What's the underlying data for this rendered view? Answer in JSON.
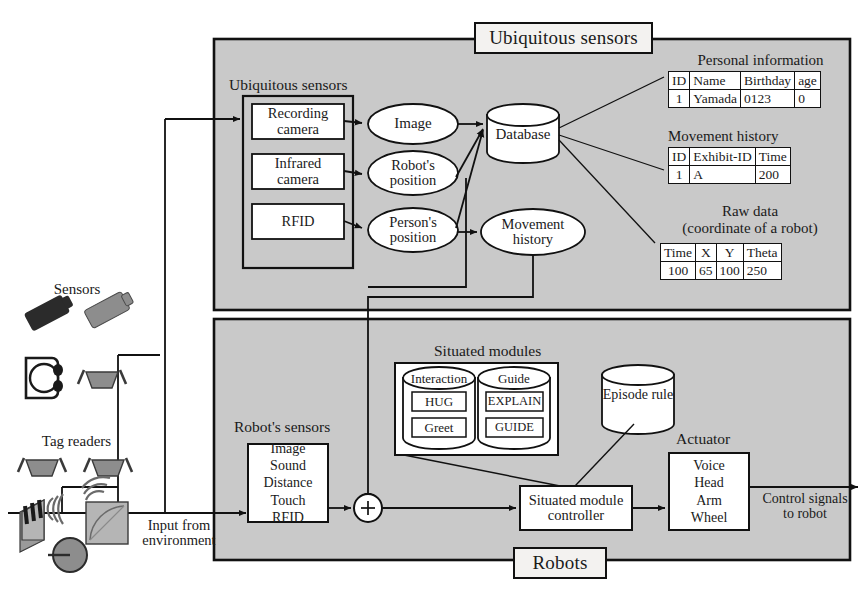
{
  "figure": {
    "top_panel_banner": "Ubiquitous sensors",
    "bottom_panel_banner": "Robots"
  },
  "top_panel": {
    "group_title": "Ubiquitous sensors",
    "sensor_boxes": [
      {
        "label": "Recording\ncamera"
      },
      {
        "label": "Infrared\ncamera"
      },
      {
        "label": "RFID"
      }
    ],
    "data_ellipses": [
      {
        "label": "Image"
      },
      {
        "label": "Robot's\nposition"
      },
      {
        "label": "Person's\nposition"
      }
    ],
    "movement_ellipse": {
      "label": "Movement\nhistory"
    },
    "database": {
      "label": "Database"
    }
  },
  "tables": [
    {
      "caption": "Personal information",
      "headers": [
        "ID",
        "Name",
        "Birthday",
        "age"
      ],
      "rows": [
        [
          "1",
          "Yamada",
          "0123",
          "0"
        ]
      ]
    },
    {
      "caption": "Movement history",
      "headers": [
        "ID",
        "Exhibit-ID",
        "Time"
      ],
      "rows": [
        [
          "1",
          "A",
          "200"
        ]
      ]
    },
    {
      "caption": "Raw data\n(coordinate of a robot)",
      "headers": [
        "Time",
        "X",
        "Y",
        "Theta"
      ],
      "rows": [
        [
          "100",
          "65",
          "100",
          "250"
        ]
      ]
    }
  ],
  "bottom_panel": {
    "robot_sensors_title": "Robot's sensors",
    "robot_sensors": {
      "label": "Image\nSound\nDistance\nTouch\nRFID"
    },
    "situated_modules_title": "Situated modules",
    "modules": [
      {
        "name": "Interaction",
        "items": [
          "HUG",
          "Greet"
        ]
      },
      {
        "name": "Guide",
        "items": [
          "EXPLAIN",
          "GUIDE"
        ]
      }
    ],
    "episode_rule": {
      "label": "Episode rule"
    },
    "controller": {
      "label": "Situated module\ncontroller"
    },
    "actuator_title": "Actuator",
    "actuator": {
      "label": "Voice\nHead\nArm\nWheel"
    },
    "sum_junction": "+",
    "input_label": "Input from\nenvironment",
    "output_label": "Control signals\nto robot"
  },
  "left_legend": {
    "sensors_title": "Sensors",
    "tag_readers_title": "Tag readers"
  },
  "colors": {
    "panel_fill": "#c9c9c9",
    "banner_fill": "#f3f2f0",
    "stroke": "#111111",
    "node_fill": "#ffffff",
    "icon_dark": "#2b2b2b",
    "icon_mid": "#8d8d8d",
    "icon_light": "#b5b5b5"
  }
}
